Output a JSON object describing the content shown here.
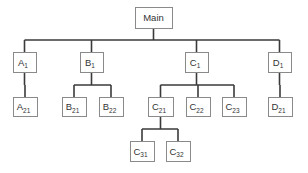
{
  "diagram": {
    "type": "hierarchy-tree",
    "colors": {
      "box_border": "#8a8a8a",
      "line": "#3a3a3a",
      "text": "#333333",
      "background": "#ffffff"
    },
    "nodes": [
      {
        "id": "main",
        "base": "Main",
        "sub": "",
        "parent": null,
        "x": 135,
        "y": 7,
        "w": 37,
        "h": 21
      },
      {
        "id": "a1",
        "base": "A",
        "sub": "1",
        "parent": "main",
        "x": 13,
        "y": 52,
        "w": 23,
        "h": 20
      },
      {
        "id": "b1",
        "base": "B",
        "sub": "1",
        "parent": "main",
        "x": 80,
        "y": 52,
        "w": 23,
        "h": 20
      },
      {
        "id": "c1",
        "base": "C",
        "sub": "1",
        "parent": "main",
        "x": 185,
        "y": 52,
        "w": 23,
        "h": 20
      },
      {
        "id": "d1",
        "base": "D",
        "sub": "1",
        "parent": "main",
        "x": 268,
        "y": 52,
        "w": 23,
        "h": 20
      },
      {
        "id": "a21",
        "base": "A",
        "sub": "21",
        "parent": "a1",
        "x": 13,
        "y": 97,
        "w": 24,
        "h": 19
      },
      {
        "id": "b21",
        "base": "B",
        "sub": "21",
        "parent": "b1",
        "x": 62,
        "y": 97,
        "w": 24,
        "h": 19
      },
      {
        "id": "b22",
        "base": "B",
        "sub": "22",
        "parent": "b1",
        "x": 99,
        "y": 97,
        "w": 24,
        "h": 19
      },
      {
        "id": "c21",
        "base": "C",
        "sub": "21",
        "parent": "c1",
        "x": 148,
        "y": 97,
        "w": 25,
        "h": 19
      },
      {
        "id": "c22",
        "base": "C",
        "sub": "22",
        "parent": "c1",
        "x": 186,
        "y": 97,
        "w": 24,
        "h": 19
      },
      {
        "id": "c23",
        "base": "C",
        "sub": "23",
        "parent": "c1",
        "x": 222,
        "y": 97,
        "w": 24,
        "h": 19
      },
      {
        "id": "d21",
        "base": "D",
        "sub": "21",
        "parent": "d1",
        "x": 268,
        "y": 97,
        "w": 24,
        "h": 19
      },
      {
        "id": "c31",
        "base": "C",
        "sub": "31",
        "parent": "c21",
        "x": 130,
        "y": 141,
        "w": 24,
        "h": 20
      },
      {
        "id": "c32",
        "base": "C",
        "sub": "32",
        "parent": "c21",
        "x": 166,
        "y": 141,
        "w": 24,
        "h": 20
      }
    ],
    "edges": [
      {
        "from": "main",
        "to": [
          "a1",
          "b1",
          "c1",
          "d1"
        ],
        "bar_y": 40
      },
      {
        "from": "a1",
        "to": [
          "a21"
        ],
        "bar_y": 85
      },
      {
        "from": "b1",
        "to": [
          "b21",
          "b22"
        ],
        "bar_y": 85
      },
      {
        "from": "c1",
        "to": [
          "c21",
          "c22",
          "c23"
        ],
        "bar_y": 85
      },
      {
        "from": "d1",
        "to": [
          "d21"
        ],
        "bar_y": 85
      },
      {
        "from": "c21",
        "to": [
          "c31",
          "c32"
        ],
        "bar_y": 129
      }
    ]
  }
}
